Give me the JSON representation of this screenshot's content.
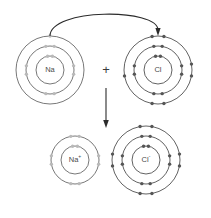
{
  "diagram": {
    "background_color": "#ffffff",
    "shell_color": "#3a3a3a",
    "electron_color": "#555555",
    "faint_electron_color": "#b9b9b9",
    "label_color": "#4a4a4a",
    "arrow_color": "#2b2b2b",
    "operator": {
      "plus_label": "+"
    },
    "atoms": [
      {
        "id": "sodium-atom",
        "label": "Na",
        "charge": "",
        "cx": 50,
        "cy": 70,
        "shells": [
          {
            "radius": 14,
            "electrons": 2,
            "electron_style": "faint"
          },
          {
            "radius": 24,
            "electrons": 8,
            "electron_style": "faint"
          },
          {
            "radius": 34,
            "electrons": 1,
            "electron_style": "faint"
          }
        ],
        "electron_counts": [
          2,
          8,
          1
        ],
        "total_electrons": 11
      },
      {
        "id": "chlorine-atom",
        "label": "Cl",
        "charge": "",
        "cx": 158,
        "cy": 70,
        "shells": [
          {
            "radius": 14,
            "electrons": 2,
            "electron_style": "solid"
          },
          {
            "radius": 24,
            "electrons": 8,
            "electron_style": "solid"
          },
          {
            "radius": 34,
            "electrons": 7,
            "electron_style": "solid"
          }
        ],
        "electron_counts": [
          2,
          8,
          7
        ],
        "total_electrons": 17
      },
      {
        "id": "sodium-ion",
        "label": "Na",
        "charge": "+",
        "cx": 75,
        "cy": 160,
        "shells": [
          {
            "radius": 14,
            "electrons": 2,
            "electron_style": "faint"
          },
          {
            "radius": 24,
            "electrons": 8,
            "electron_style": "faint"
          }
        ],
        "electron_counts": [
          2,
          8
        ],
        "total_electrons": 10
      },
      {
        "id": "chloride-ion",
        "label": "Cl",
        "charge": "-",
        "cx": 146,
        "cy": 160,
        "shells": [
          {
            "radius": 14,
            "electrons": 2,
            "electron_style": "solid"
          },
          {
            "radius": 24,
            "electrons": 8,
            "electron_style": "solid"
          },
          {
            "radius": 34,
            "electrons": 8,
            "electron_style": "solid"
          }
        ],
        "electron_counts": [
          2,
          8,
          8
        ],
        "total_electrons": 18
      }
    ],
    "arrows": [
      {
        "id": "electron-transfer-arrow",
        "type": "curved",
        "description": "electron transfer from sodium outer shell to chlorine outer shell",
        "from_x": 50,
        "from_y": 36,
        "to_x": 158,
        "to_y": 36
      },
      {
        "id": "reaction-arrow",
        "type": "straight-down",
        "description": "reaction proceeds downward to products",
        "from_x": 106,
        "from_y": 88,
        "to_x": 106,
        "to_y": 128
      }
    ]
  }
}
